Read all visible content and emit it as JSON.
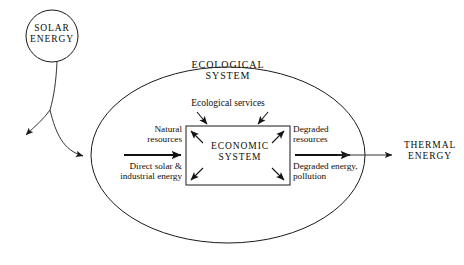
{
  "figure": {
    "type": "diagram",
    "kind": "energy-flow-systems-diagram",
    "background": "#ffffff",
    "line_color": "#1a1a1a"
  },
  "nodes": {
    "solar": {
      "label_line1": "SOLAR",
      "label_line2": "ENERGY",
      "shape": "circle",
      "cx": 52,
      "cy": 36,
      "r": 26
    },
    "ecological": {
      "label_line1": "ECOLOGICAL",
      "label_line2": "SYSTEM",
      "shape": "ellipse",
      "cx": 228,
      "cy": 155,
      "rx": 137,
      "ry": 88
    },
    "economic": {
      "label_line1": "ECONOMIC",
      "label_line2": "SYSTEM",
      "shape": "rectangle",
      "x": 186,
      "y": 126,
      "width": 104,
      "height": 59
    },
    "thermal": {
      "label_line1": "THERMAL",
      "label_line2": "ENERGY"
    }
  },
  "flows": {
    "ecological_services": "Ecological services",
    "natural_resources": "Natural\nresources",
    "natural_resources_line1": "Natural",
    "natural_resources_line2": "resources",
    "direct_solar_line1": "Direct solar &",
    "direct_solar_line2": "industrial energy",
    "degraded_resources_line1": "Degraded",
    "degraded_resources_line2": "resources",
    "degraded_energy_line1": "Degraded energy,",
    "degraded_energy_line2": "pollution"
  },
  "caption": {
    "clipped_text": ""
  }
}
